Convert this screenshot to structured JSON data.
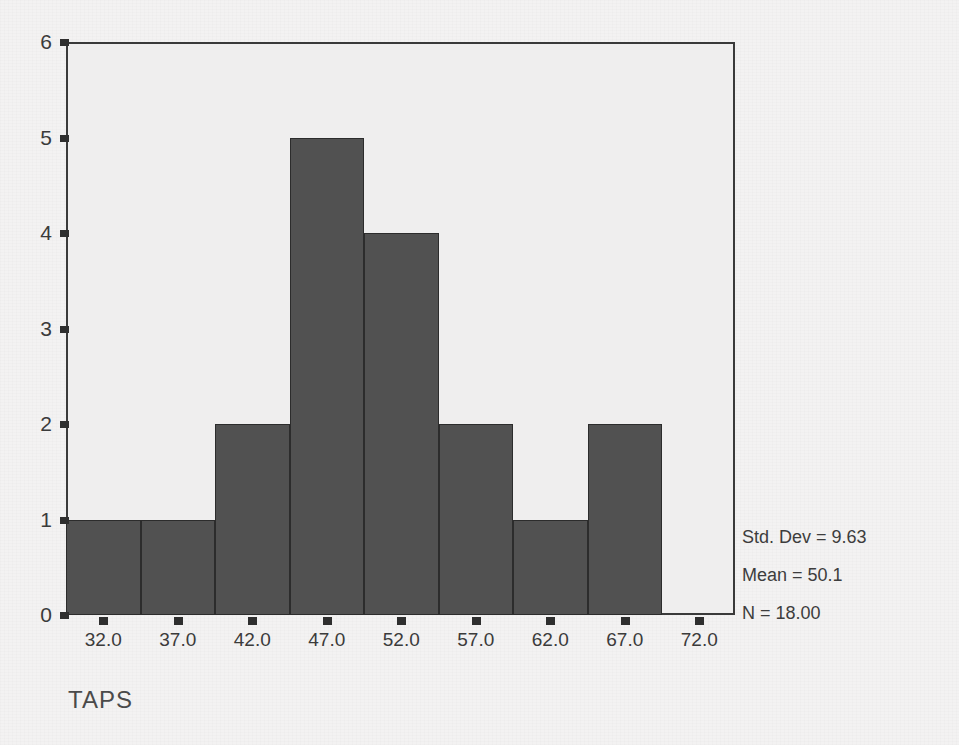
{
  "chart_data": {
    "type": "bar",
    "title": "",
    "subtitle": "",
    "xlabel": "TAPS",
    "ylabel": "",
    "categories": [
      "32.0",
      "37.0",
      "42.0",
      "47.0",
      "52.0",
      "57.0",
      "62.0",
      "67.0"
    ],
    "values": [
      1,
      1,
      2,
      5,
      4,
      2,
      1,
      2
    ],
    "bin_centers": [
      32.0,
      37.0,
      42.0,
      47.0,
      52.0,
      57.0,
      62.0,
      67.0
    ],
    "bin_width": 5,
    "xtick_labels": [
      "32.0",
      "37.0",
      "42.0",
      "47.0",
      "52.0",
      "57.0",
      "62.0",
      "67.0",
      "72.0"
    ],
    "ytick_labels": [
      "0",
      "1",
      "2",
      "3",
      "4",
      "5",
      "6"
    ],
    "ylim": [
      0,
      6
    ],
    "xlim": [
      29.5,
      74.5
    ],
    "grid": false,
    "legend": false,
    "bar_color": "#515151",
    "bar_edge_color": "#2c2c2c",
    "plot_background": "#efeeee",
    "figure_background": "#f3f2f2",
    "axis_color": "#3a3a3a",
    "annotations": [
      "Std. Dev = 9.63",
      "Mean = 50.1",
      "N = 18.00"
    ]
  },
  "axes": {
    "y": {
      "ticks": [
        {
          "label": "0",
          "value": 0
        },
        {
          "label": "1",
          "value": 1
        },
        {
          "label": "2",
          "value": 2
        },
        {
          "label": "3",
          "value": 3
        },
        {
          "label": "4",
          "value": 4
        },
        {
          "label": "5",
          "value": 5
        },
        {
          "label": "6",
          "value": 6
        }
      ]
    },
    "x": {
      "title": "TAPS",
      "ticks": [
        {
          "label": "32.0",
          "value": 32.0
        },
        {
          "label": "37.0",
          "value": 37.0
        },
        {
          "label": "42.0",
          "value": 42.0
        },
        {
          "label": "47.0",
          "value": 47.0
        },
        {
          "label": "52.0",
          "value": 52.0
        },
        {
          "label": "57.0",
          "value": 57.0
        },
        {
          "label": "62.0",
          "value": 62.0
        },
        {
          "label": "67.0",
          "value": 67.0
        },
        {
          "label": "72.0",
          "value": 72.0
        }
      ]
    }
  },
  "stats": {
    "std_dev": "Std. Dev = 9.63",
    "mean": "Mean = 50.1",
    "n": "N = 18.00"
  }
}
